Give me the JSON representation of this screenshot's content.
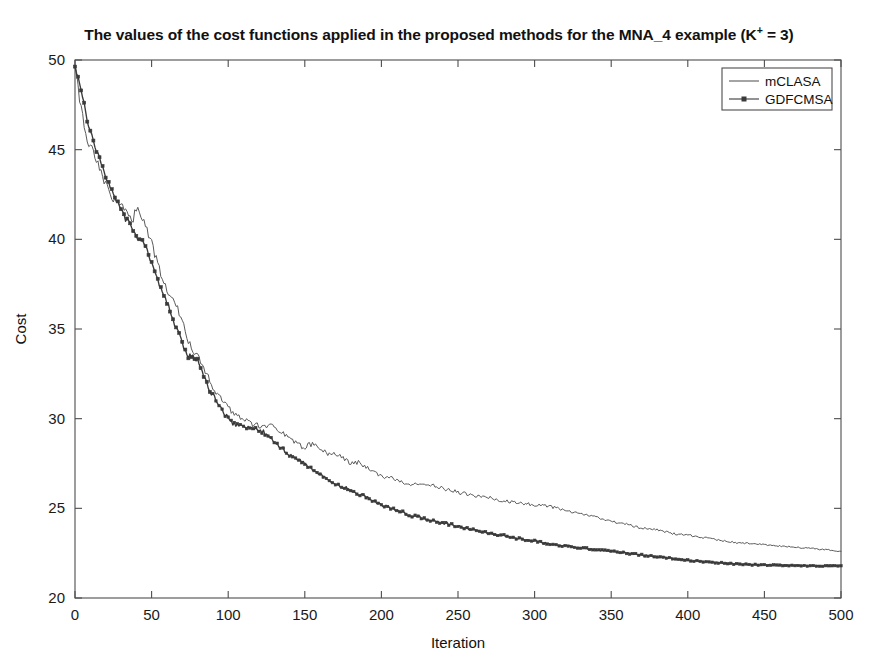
{
  "figure": {
    "width": 878,
    "height": 666,
    "background": "#ffffff"
  },
  "title": {
    "prefix": "The values of the cost functions applied in the proposed methods for the MNA_4 example (K",
    "superscript": "+",
    "suffix": " = 3)",
    "full": "The values of the cost functions applied in the proposed methods for the MNA_4 example (K+ = 3)"
  },
  "axes": {
    "x_label": "Iteration",
    "y_label": "Cost",
    "x_ticks": [
      "0",
      "50",
      "100",
      "150",
      "200",
      "250",
      "300",
      "350",
      "400",
      "450",
      "500"
    ],
    "y_ticks": [
      "20",
      "25",
      "30",
      "35",
      "40",
      "45",
      "50"
    ]
  },
  "legend": {
    "position": "top-right",
    "entries": [
      {
        "label": "mCLASA",
        "color": "#5a5a5a",
        "marker": "none"
      },
      {
        "label": "GDFCMSA",
        "color": "#3a3a3a",
        "marker": "square"
      }
    ]
  },
  "chart_data": {
    "type": "line",
    "title": "The values of the cost functions applied in the proposed methods for the MNA_4 example (K+ = 3)",
    "xlabel": "Iteration",
    "ylabel": "Cost",
    "xlim": [
      0,
      500
    ],
    "ylim": [
      20,
      50
    ],
    "xticks": [
      0,
      50,
      100,
      150,
      200,
      250,
      300,
      350,
      400,
      450,
      500
    ],
    "yticks": [
      20,
      25,
      30,
      35,
      40,
      45,
      50
    ],
    "grid": false,
    "legend_position": "upper right",
    "x": [
      0,
      2,
      4,
      6,
      8,
      10,
      12,
      14,
      16,
      18,
      20,
      22,
      24,
      26,
      28,
      30,
      32,
      34,
      36,
      38,
      40,
      42,
      44,
      46,
      48,
      50,
      52,
      54,
      56,
      58,
      60,
      62,
      64,
      66,
      68,
      70,
      72,
      74,
      76,
      78,
      80,
      84,
      88,
      92,
      96,
      100,
      104,
      108,
      112,
      116,
      120,
      124,
      128,
      132,
      136,
      140,
      145,
      150,
      155,
      160,
      165,
      170,
      175,
      180,
      185,
      190,
      195,
      200,
      210,
      220,
      230,
      240,
      250,
      260,
      270,
      280,
      290,
      300,
      310,
      320,
      330,
      340,
      350,
      360,
      370,
      380,
      390,
      400,
      415,
      430,
      445,
      460,
      475,
      490,
      500
    ],
    "series": [
      {
        "name": "mCLASA",
        "color": "#5a5a5a",
        "marker": "none",
        "values": [
          49.8,
          48.6,
          47.2,
          46.3,
          45.6,
          45.1,
          44.9,
          44.4,
          43.9,
          43.4,
          43.0,
          42.7,
          42.4,
          42.1,
          42.0,
          41.9,
          41.7,
          41.5,
          41.3,
          41.1,
          41.8,
          41.6,
          41.2,
          40.8,
          40.3,
          39.8,
          39.2,
          38.6,
          38.1,
          37.6,
          37.1,
          36.7,
          36.6,
          36.3,
          35.9,
          35.4,
          34.8,
          34.3,
          33.9,
          33.6,
          33.5,
          32.8,
          32.1,
          31.5,
          31.0,
          30.6,
          30.3,
          30.1,
          29.9,
          29.7,
          29.6,
          29.5,
          29.8,
          29.5,
          29.2,
          28.9,
          28.6,
          28.4,
          28.6,
          28.3,
          28.0,
          28.1,
          27.8,
          27.5,
          27.6,
          27.3,
          27.0,
          26.8,
          26.6,
          26.3,
          26.4,
          26.1,
          25.9,
          25.7,
          25.6,
          25.4,
          25.3,
          25.2,
          25.1,
          24.9,
          24.7,
          24.5,
          24.3,
          24.1,
          23.9,
          23.8,
          23.6,
          23.5,
          23.3,
          23.1,
          23.0,
          22.9,
          22.8,
          22.7,
          22.6
        ]
      },
      {
        "name": "GDFCMSA",
        "color": "#3a3a3a",
        "marker": "square",
        "values": [
          49.7,
          49.0,
          48.3,
          47.5,
          46.7,
          46.0,
          45.4,
          44.9,
          44.4,
          44.0,
          43.6,
          43.2,
          42.8,
          42.4,
          42.1,
          41.7,
          41.3,
          41.0,
          40.8,
          40.5,
          40.2,
          40.0,
          39.9,
          39.6,
          39.2,
          38.7,
          38.2,
          37.8,
          37.3,
          36.9,
          36.5,
          36.0,
          35.5,
          35.1,
          34.7,
          34.2,
          33.8,
          33.5,
          33.5,
          33.4,
          33.3,
          32.4,
          31.6,
          31.0,
          30.4,
          30.0,
          29.7,
          29.6,
          29.5,
          29.5,
          29.4,
          29.2,
          28.9,
          28.6,
          28.3,
          28.0,
          27.7,
          27.5,
          27.2,
          26.9,
          26.6,
          26.4,
          26.2,
          26.0,
          25.8,
          25.6,
          25.4,
          25.2,
          24.9,
          24.6,
          24.4,
          24.2,
          24.0,
          23.8,
          23.6,
          23.5,
          23.3,
          23.2,
          23.0,
          22.9,
          22.8,
          22.7,
          22.6,
          22.5,
          22.4,
          22.3,
          22.2,
          22.1,
          22.0,
          21.9,
          21.85,
          21.82,
          21.8,
          21.79,
          21.78
        ]
      }
    ]
  }
}
